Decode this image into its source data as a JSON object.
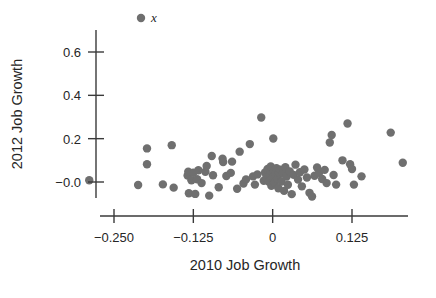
{
  "chart_data": {
    "type": "scatter",
    "title": "",
    "xlabel": "2010 Job Growth",
    "ylabel": "2012 Job Growth",
    "xlim": [
      -0.295,
      0.215
    ],
    "ylim": [
      -0.085,
      0.735
    ],
    "grid": false,
    "legend_position": "top-center",
    "legend": [
      {
        "label": "x",
        "marker": "filled-circle",
        "color": "#6f6f6f"
      }
    ],
    "x_ticks": [
      -0.25,
      -0.125,
      0,
      0.125
    ],
    "x_tick_labels": [
      "−0.250",
      "−0.125",
      "0",
      "0.125"
    ],
    "y_ticks": [
      0.6,
      0.4,
      0.2,
      0.0
    ],
    "y_tick_labels": [
      "0.6",
      "0.4",
      "0.2",
      "−0.0"
    ],
    "marker_color": "#6f6f6f",
    "marker_size": 4.2,
    "series": [
      {
        "name": "x",
        "points": [
          [
            -0.289,
            0.008
          ],
          [
            -0.212,
            -0.014
          ],
          [
            -0.198,
            0.155
          ],
          [
            -0.198,
            0.082
          ],
          [
            -0.173,
            -0.011
          ],
          [
            -0.159,
            0.17
          ],
          [
            -0.156,
            -0.026
          ],
          [
            -0.134,
            0.03
          ],
          [
            -0.133,
            0.048
          ],
          [
            -0.132,
            -0.052
          ],
          [
            -0.128,
            0.008
          ],
          [
            -0.125,
            0.043
          ],
          [
            -0.122,
            -0.055
          ],
          [
            -0.119,
            0.013
          ],
          [
            -0.117,
            0.054
          ],
          [
            -0.112,
            -0.005
          ],
          [
            -0.106,
            0.047
          ],
          [
            -0.104,
            0.074
          ],
          [
            -0.1,
            -0.063
          ],
          [
            -0.096,
            0.12
          ],
          [
            -0.094,
            0.031
          ],
          [
            -0.085,
            -0.024
          ],
          [
            -0.079,
            0.108
          ],
          [
            -0.078,
            0.092
          ],
          [
            -0.073,
            0.028
          ],
          [
            -0.066,
            0.042
          ],
          [
            -0.064,
            0.094
          ],
          [
            -0.056,
            -0.031
          ],
          [
            -0.052,
            0.14
          ],
          [
            -0.046,
            -0.007
          ],
          [
            -0.042,
            0.012
          ],
          [
            -0.036,
            0.175
          ],
          [
            -0.031,
            0.026
          ],
          [
            -0.028,
            -0.012
          ],
          [
            -0.024,
            0.035
          ],
          [
            -0.018,
            0.298
          ],
          [
            -0.014,
            0.006
          ],
          [
            -0.012,
            0.044
          ],
          [
            -0.01,
            0.019
          ],
          [
            -0.008,
            0.06
          ],
          [
            -0.006,
            0.001
          ],
          [
            -0.004,
            0.036
          ],
          [
            -0.003,
            0.072
          ],
          [
            -0.002,
            -0.018
          ],
          [
            0.0,
            0.022
          ],
          [
            0.001,
            0.201
          ],
          [
            0.002,
            0.051
          ],
          [
            0.003,
            -0.004
          ],
          [
            0.004,
            0.03
          ],
          [
            0.006,
            0.064
          ],
          [
            0.008,
            0.014
          ],
          [
            0.009,
            -0.029
          ],
          [
            0.01,
            0.042
          ],
          [
            0.012,
            0.057
          ],
          [
            0.014,
            0.002
          ],
          [
            0.016,
            0.039
          ],
          [
            0.018,
            -0.041
          ],
          [
            0.02,
            0.068
          ],
          [
            0.022,
            0.025
          ],
          [
            0.024,
            -0.013
          ],
          [
            0.027,
            0.049
          ],
          [
            0.03,
            -0.056
          ],
          [
            0.033,
            0.033
          ],
          [
            0.036,
            0.08
          ],
          [
            0.04,
            0.011
          ],
          [
            0.043,
            0.045
          ],
          [
            0.046,
            -0.02
          ],
          [
            0.05,
            0.058
          ],
          [
            0.054,
            0.021
          ],
          [
            0.058,
            -0.05
          ],
          [
            0.062,
            -0.067
          ],
          [
            0.066,
            0.029
          ],
          [
            0.07,
            0.067
          ],
          [
            0.073,
            0.042
          ],
          [
            0.078,
            0.014
          ],
          [
            0.082,
            0.056
          ],
          [
            0.085,
            -0.005
          ],
          [
            0.09,
            0.182
          ],
          [
            0.093,
            0.217
          ],
          [
            0.096,
            0.032
          ],
          [
            0.1,
            -0.012
          ],
          [
            0.11,
            0.1
          ],
          [
            0.118,
            0.27
          ],
          [
            0.122,
            0.082
          ],
          [
            0.125,
            0.06
          ],
          [
            0.128,
            -0.012
          ],
          [
            0.14,
            0.026
          ],
          [
            0.186,
            0.228
          ],
          [
            0.205,
            0.089
          ]
        ]
      }
    ]
  },
  "legend_marker_label": "x"
}
